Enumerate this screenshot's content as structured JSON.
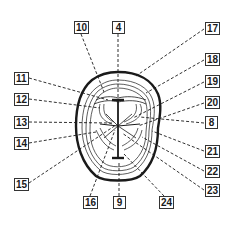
{
  "diagram": {
    "type": "tooth-occlusal-view",
    "colors": {
      "line": "#1a1a1a",
      "background": "#ffffff",
      "label_border": "#333333"
    },
    "labels": [
      {
        "id": "l10",
        "text": "10",
        "x": 74,
        "y": 21,
        "anchor": [
          81,
          34
        ],
        "target": [
          104,
          92
        ]
      },
      {
        "id": "l4",
        "text": "4",
        "x": 112,
        "y": 21,
        "anchor": [
          118,
          34
        ],
        "target": [
          118,
          98
        ]
      },
      {
        "id": "l17",
        "text": "17",
        "x": 205,
        "y": 22,
        "anchor": [
          204,
          29
        ],
        "target": [
          136,
          76
        ]
      },
      {
        "id": "l11",
        "text": "11",
        "x": 14,
        "y": 72,
        "anchor": [
          29,
          78
        ],
        "target": [
          108,
          100
        ]
      },
      {
        "id": "l12",
        "text": "12",
        "x": 14,
        "y": 93,
        "anchor": [
          29,
          99
        ],
        "target": [
          100,
          108
        ]
      },
      {
        "id": "l13",
        "text": "13",
        "x": 14,
        "y": 116,
        "anchor": [
          29,
          122
        ],
        "target": [
          112,
          123
        ]
      },
      {
        "id": "l14",
        "text": "14",
        "x": 14,
        "y": 137,
        "anchor": [
          29,
          143
        ],
        "target": [
          96,
          132
        ]
      },
      {
        "id": "l15",
        "text": "15",
        "x": 14,
        "y": 178,
        "anchor": [
          29,
          183
        ],
        "target": [
          116,
          125
        ]
      },
      {
        "id": "l18",
        "text": "18",
        "x": 205,
        "y": 53,
        "anchor": [
          204,
          60
        ],
        "target": [
          146,
          93
        ]
      },
      {
        "id": "l19",
        "text": "19",
        "x": 205,
        "y": 75,
        "anchor": [
          204,
          82
        ],
        "target": [
          133,
          118
        ]
      },
      {
        "id": "l20",
        "text": "20",
        "x": 205,
        "y": 96,
        "anchor": [
          204,
          103
        ],
        "target": [
          138,
          126
        ]
      },
      {
        "id": "l8",
        "text": "8",
        "x": 205,
        "y": 116,
        "anchor": [
          204,
          123
        ],
        "target": [
          140,
          117
        ]
      },
      {
        "id": "l21",
        "text": "21",
        "x": 205,
        "y": 145,
        "anchor": [
          204,
          151
        ],
        "target": [
          152,
          131
        ]
      },
      {
        "id": "l22",
        "text": "22",
        "x": 205,
        "y": 165,
        "anchor": [
          204,
          171
        ],
        "target": [
          142,
          137
        ]
      },
      {
        "id": "l23",
        "text": "23",
        "x": 205,
        "y": 184,
        "anchor": [
          204,
          190
        ],
        "target": [
          122,
          133
        ]
      },
      {
        "id": "l16",
        "text": "16",
        "x": 83,
        "y": 196,
        "anchor": [
          90,
          196
        ],
        "target": [
          115,
          130
        ]
      },
      {
        "id": "l9",
        "text": "9",
        "x": 113,
        "y": 196,
        "anchor": [
          119,
          196
        ],
        "target": [
          119,
          162
        ]
      },
      {
        "id": "l24",
        "text": "24",
        "x": 159,
        "y": 196,
        "anchor": [
          164,
          196
        ],
        "target": [
          124,
          154
        ]
      }
    ]
  }
}
